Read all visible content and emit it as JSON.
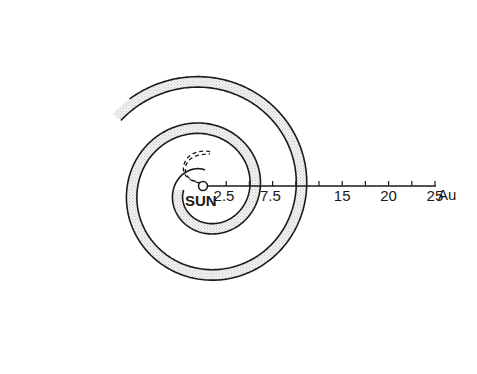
{
  "diagram": {
    "title": "",
    "center_label": "SUN",
    "axis": {
      "unit": "Au",
      "tick_step": 2.5,
      "max": 25,
      "labeled_ticks": [
        {
          "value": 2.5,
          "label": "2.5"
        },
        {
          "value": 7.5,
          "label": "7.5"
        },
        {
          "value": 15,
          "label": "15"
        },
        {
          "value": 20,
          "label": "20"
        },
        {
          "value": 25,
          "label": "25"
        }
      ],
      "unit_label": "Au"
    },
    "spirals": [
      {
        "name": "inner-spiral",
        "style": "solid"
      },
      {
        "name": "outer-spiral",
        "style": "solid"
      },
      {
        "name": "inner-start",
        "style": "dashed"
      }
    ],
    "colors": {
      "line": "#1a1a1a",
      "band": "#e4e4e4",
      "background": "#ffffff"
    }
  }
}
